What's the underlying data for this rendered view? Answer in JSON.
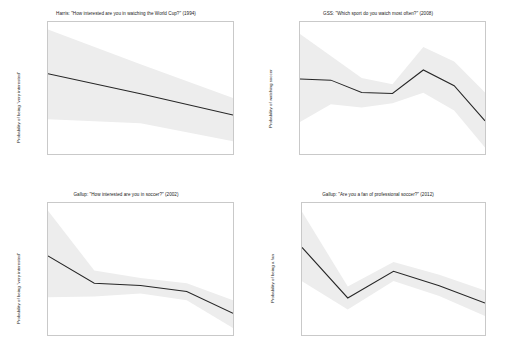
{
  "figure": {
    "panel_count": 4,
    "band_color": "#ededed",
    "line_color": "#262626",
    "axis_color": "#c9c9c9"
  },
  "chart_data": [
    {
      "type": "line",
      "panel": "top-left",
      "title": "Harris: \"How interested are you in watching the World Cup?\" (1994)",
      "xlabel": "",
      "ylabel": "Probability of being \"very interested\"",
      "categories": [
        "Lib",
        "Mod",
        "Con"
      ],
      "yticks": [
        "0.24",
        "0.22",
        "0.20",
        "0.18",
        "0.16",
        "0.14",
        "0.12"
      ],
      "ytick_values": [
        0.24,
        0.22,
        0.2,
        0.18,
        0.16,
        0.14,
        0.12
      ],
      "ylim": [
        0.12,
        0.245
      ],
      "grid": false,
      "legend": "none",
      "series": [
        {
          "name": "predicted probability",
          "values": [
            0.196,
            0.177,
            0.157
          ]
        },
        {
          "name": "ci_upper",
          "values": [
            0.238,
            0.205,
            0.173
          ]
        },
        {
          "name": "ci_lower",
          "values": [
            0.153,
            0.149,
            0.132
          ]
        }
      ]
    },
    {
      "type": "line",
      "panel": "top-right",
      "title": "GSS: \"Which sport do you watch most often?\" (2008)",
      "xlabel": "",
      "ylabel": "Probability of watching soccer",
      "categories": [
        "Ext Lib",
        "Lib",
        "Sl Lib",
        "Mod",
        "Sl Cons",
        "Cons",
        "Ext Cons"
      ],
      "yticks": [
        "0.12",
        "0.10",
        "0.08",
        "0.06",
        "0.04",
        "0.02",
        "0"
      ],
      "ytick_values": [
        0.12,
        0.1,
        0.08,
        0.06,
        0.04,
        0.02,
        0
      ],
      "ylim": [
        -0.006,
        0.12
      ],
      "grid": false,
      "legend": "none",
      "series": [
        {
          "name": "predicted probability",
          "values": [
            0.0655,
            0.0645,
            0.0527,
            0.0518,
            0.0742,
            0.0592,
            0.0257
          ]
        },
        {
          "name": "ci_upper",
          "values": [
            0.1085,
            0.0875,
            0.0665,
            0.0605,
            0.0962,
            0.0822,
            0.0527
          ]
        },
        {
          "name": "ci_lower",
          "values": [
            0.0245,
            0.0415,
            0.0385,
            0.0425,
            0.0525,
            0.0355,
            0.0002
          ]
        }
      ]
    },
    {
      "type": "line",
      "panel": "bottom-left",
      "title": "Gallup: \"How interested are you in soccer?\" (2002)",
      "xlabel": "",
      "ylabel": "Probability of being \"very interested\"",
      "categories": [
        "Very Lib",
        "SW Lib",
        "Mod",
        "SW Con",
        "Very Con"
      ],
      "yticks": [
        "0.20",
        "0.15",
        "0.10",
        "0.05"
      ],
      "ytick_values": [
        0.2,
        0.15,
        0.1,
        0.05
      ],
      "ylim": [
        0.029,
        0.206
      ],
      "grid": false,
      "legend": "none",
      "series": [
        {
          "name": "predicted probability",
          "values": [
            0.135,
            0.0985,
            0.0955,
            0.0872,
            0.0582
          ]
        },
        {
          "name": "ci_upper",
          "values": [
            0.1955,
            0.1155,
            0.1055,
            0.0985,
            0.0755
          ]
        },
        {
          "name": "ci_lower",
          "values": [
            0.0795,
            0.0805,
            0.0845,
            0.0755,
            0.0385
          ]
        }
      ]
    },
    {
      "type": "line",
      "panel": "bottom-right",
      "title": "Gallup: \"Are you a fan of professional soccer?\" (2012)",
      "xlabel": "",
      "ylabel": "Probability of being a fan",
      "categories": [
        "Very Lib",
        "SW Lib",
        "Mod",
        "SW Con",
        "Very Con"
      ],
      "yticks": [
        "0.45",
        "0.40",
        "0.35",
        "0.30",
        "0.25",
        "0.20",
        "0.15",
        "0.10",
        "0.05"
      ],
      "ytick_values": [
        0.45,
        0.4,
        0.35,
        0.3,
        0.25,
        0.2,
        0.15,
        0.1,
        0.05
      ],
      "ylim": [
        0.045,
        0.455
      ],
      "grid": false,
      "legend": "none",
      "series": [
        {
          "name": "predicted probability",
          "values": [
            0.317,
            0.16,
            0.243,
            0.198,
            0.144
          ]
        },
        {
          "name": "ci_upper",
          "values": [
            0.428,
            0.196,
            0.272,
            0.232,
            0.183
          ]
        },
        {
          "name": "ci_lower",
          "values": [
            0.212,
            0.124,
            0.213,
            0.166,
            0.104
          ]
        }
      ]
    }
  ]
}
